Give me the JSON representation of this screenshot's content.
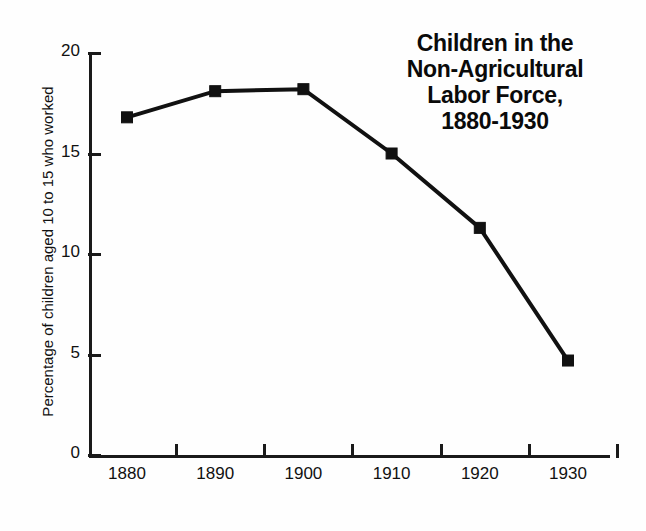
{
  "chart_data": {
    "type": "line",
    "title": "Children in the Non-Agricultural Labor Force, 1880-1930",
    "title_lines": [
      "Children in the",
      "Non-Agricultural",
      "Labor Force,",
      "1880-1930"
    ],
    "xlabel": "",
    "ylabel": "Percentage of children aged 10 to 15 who worked",
    "categories": [
      "1880",
      "1890",
      "1900",
      "1910",
      "1920",
      "1930"
    ],
    "x": [
      1880,
      1890,
      1900,
      1910,
      1920,
      1930
    ],
    "values": [
      16.8,
      18.1,
      18.2,
      15.0,
      11.3,
      4.7
    ],
    "series": [
      {
        "name": "Percentage of children aged 10 to 15 who worked",
        "values": [
          16.8,
          18.1,
          18.2,
          15.0,
          11.3,
          4.7
        ]
      }
    ],
    "ylim": [
      0,
      20
    ],
    "ytick_labels": [
      "0",
      "5",
      "10",
      "15",
      "20"
    ],
    "yticks": [
      0,
      5,
      10,
      15,
      20
    ],
    "xtick_labels": [
      "1880",
      "1890",
      "1900",
      "1910",
      "1920",
      "1930"
    ],
    "grid": false,
    "legend": false,
    "legend_position": "none",
    "marker": "square",
    "line_color": "#111111",
    "marker_color": "#111111",
    "background_color": "#ffffff"
  }
}
